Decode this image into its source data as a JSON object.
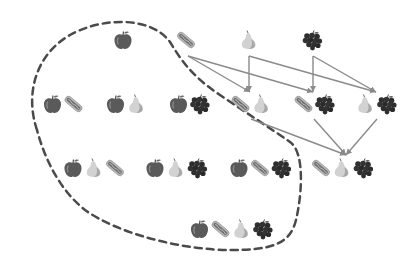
{
  "diagram": {
    "width": 414,
    "height": 273,
    "colors": {
      "background": "#ffffff",
      "dashed_region": "#4a4a4a",
      "arrow": "#8a8a8a",
      "apple": "#5a5a5a",
      "apple_highlight": "#8c8c8c",
      "hotdog_bun": "#b8b8b8",
      "hotdog_sausage": "#6e6e6e",
      "pear": "#d2d2d2",
      "pear_shade": "#a8a8a8",
      "grapes": "#2e2e2e"
    },
    "items": [
      "apple",
      "hotdog",
      "pear",
      "grapes"
    ],
    "icon_size": 20,
    "nodes": [
      {
        "id": "a",
        "set": [
          "apple"
        ],
        "x": 123,
        "y": 40
      },
      {
        "id": "h",
        "set": [
          "hotdog"
        ],
        "x": 186,
        "y": 40
      },
      {
        "id": "p",
        "set": [
          "pear"
        ],
        "x": 249,
        "y": 40
      },
      {
        "id": "g",
        "set": [
          "grapes"
        ],
        "x": 312,
        "y": 40
      },
      {
        "id": "ah",
        "set": [
          "apple",
          "hotdog"
        ],
        "x": 63,
        "y": 104
      },
      {
        "id": "ap",
        "set": [
          "apple",
          "pear"
        ],
        "x": 126,
        "y": 104
      },
      {
        "id": "ag",
        "set": [
          "apple",
          "grapes"
        ],
        "x": 189,
        "y": 104
      },
      {
        "id": "hp",
        "set": [
          "hotdog",
          "pear"
        ],
        "x": 251,
        "y": 104
      },
      {
        "id": "hg",
        "set": [
          "hotdog",
          "grapes"
        ],
        "x": 314,
        "y": 104
      },
      {
        "id": "pg",
        "set": [
          "pear",
          "grapes"
        ],
        "x": 376,
        "y": 104
      },
      {
        "id": "aph",
        "set": [
          "apple",
          "pear",
          "hotdog"
        ],
        "x": 94,
        "y": 168
      },
      {
        "id": "apg",
        "set": [
          "apple",
          "pear",
          "grapes"
        ],
        "x": 176,
        "y": 168
      },
      {
        "id": "ahg",
        "set": [
          "apple",
          "hotdog",
          "grapes"
        ],
        "x": 260,
        "y": 168
      },
      {
        "id": "hpg",
        "set": [
          "hotdog",
          "pear",
          "grapes"
        ],
        "x": 342,
        "y": 168
      },
      {
        "id": "ahpg",
        "set": [
          "apple",
          "hotdog",
          "pear",
          "grapes"
        ],
        "x": 231,
        "y": 229
      }
    ],
    "arrows": [
      {
        "from": [
          188,
          56
        ],
        "to": [
          250,
          92
        ]
      },
      {
        "from": [
          188,
          56
        ],
        "to": [
          313,
          92
        ]
      },
      {
        "from": [
          249,
          56
        ],
        "to": [
          249,
          92
        ]
      },
      {
        "from": [
          249,
          56
        ],
        "to": [
          376,
          92
        ]
      },
      {
        "from": [
          313,
          56
        ],
        "to": [
          313,
          92
        ]
      },
      {
        "from": [
          313,
          56
        ],
        "to": [
          376,
          92
        ]
      },
      {
        "from": [
          251,
          119
        ],
        "to": [
          346,
          155
        ]
      },
      {
        "from": [
          314,
          119
        ],
        "to": [
          346,
          155
        ]
      },
      {
        "from": [
          377,
          119
        ],
        "to": [
          346,
          155
        ]
      }
    ],
    "region": {
      "label": "sets-containing-apple",
      "path": "M 37 130 C 25 95, 35 55, 70 35 C 100 18, 150 15, 170 42 C 180 58, 190 75, 220 95 C 245 112, 270 128, 290 142 C 305 152, 302 195, 296 220 C 290 245, 270 250, 230 250 C 185 250, 120 235, 85 210 C 60 190, 45 160, 37 130 Z",
      "dash": "7,5",
      "stroke_width": 2.5
    }
  }
}
